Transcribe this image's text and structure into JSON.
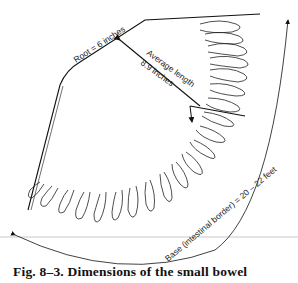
{
  "figure": {
    "caption": "Fig. 8–3. Dimensions of the small bowel",
    "labels": {
      "root": "Root = 6 inches",
      "average_length_line1": "Average length",
      "average_length_line2": "8.9 inches",
      "base": "Base (intestinal border) = 20 – 22 feet"
    }
  }
}
